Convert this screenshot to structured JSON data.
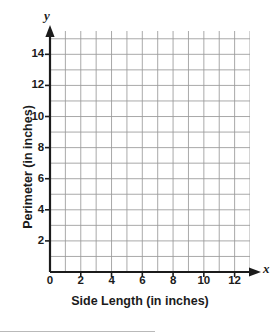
{
  "chart_data": {
    "type": "line",
    "title": "",
    "subtitle": "",
    "xlabel": "Side Length (in inches)",
    "ylabel": "Perimeter (in inches)",
    "x_axis_letter": "y",
    "y_axis_letter": "x",
    "axis_letters": {
      "x": "x",
      "y": "y"
    },
    "xlim": [
      0,
      13
    ],
    "ylim": [
      0,
      15.5
    ],
    "grid": true,
    "grid_step": 1,
    "legend": "none",
    "annotations": [],
    "series": [],
    "x_ticks": [
      {
        "value": 0,
        "label": "0"
      },
      {
        "value": 2,
        "label": "2"
      },
      {
        "value": 4,
        "label": "4"
      },
      {
        "value": 6,
        "label": "6"
      },
      {
        "value": 8,
        "label": "8"
      },
      {
        "value": 10,
        "label": "10"
      },
      {
        "value": 12,
        "label": "12"
      }
    ],
    "y_ticks": [
      {
        "value": 2,
        "label": "2"
      },
      {
        "value": 4,
        "label": "4"
      },
      {
        "value": 6,
        "label": "6"
      },
      {
        "value": 8,
        "label": "8"
      },
      {
        "value": 10,
        "label": "10"
      },
      {
        "value": 12,
        "label": "12"
      },
      {
        "value": 14,
        "label": "14"
      }
    ],
    "colors": {
      "grid_line": "#9a9a9a",
      "axis_line": "#1b1b1b",
      "text": "#1b1b1b",
      "background": "#ffffff"
    }
  }
}
